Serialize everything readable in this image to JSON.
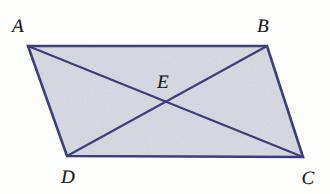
{
  "figure": {
    "kind": "geometry-diagram",
    "canvas": {
      "width": 330,
      "height": 194
    },
    "colors": {
      "background": "#fdfdfb",
      "interior_fill": "#d8dae4",
      "stroke": "#3b3f7c",
      "label_text": "#19171c"
    },
    "stroke_width": 2.4,
    "shape": {
      "name": "parallelogram",
      "vertices": [
        {
          "id": "A",
          "x": 28,
          "y": 46
        },
        {
          "id": "B",
          "x": 267,
          "y": 46
        },
        {
          "id": "C",
          "x": 303,
          "y": 157
        },
        {
          "id": "D",
          "x": 67,
          "y": 156
        }
      ],
      "polygon_points": "28,46 267,46 303,157 67,156"
    },
    "diagonals": [
      {
        "id": "AC",
        "from": "A",
        "to": "C",
        "x1": 28,
        "y1": 46,
        "x2": 303,
        "y2": 157
      },
      {
        "id": "BD",
        "from": "B",
        "to": "D",
        "x1": 267,
        "y1": 46,
        "x2": 67,
        "y2": 156
      }
    ],
    "intersection": {
      "id": "E",
      "x": 166,
      "y": 101
    },
    "labels": [
      {
        "id": "A",
        "text": "A",
        "x": 18,
        "y": 26
      },
      {
        "id": "B",
        "text": "B",
        "x": 263,
        "y": 26
      },
      {
        "id": "E",
        "text": "E",
        "x": 163,
        "y": 82
      },
      {
        "id": "D",
        "text": "D",
        "x": 68,
        "y": 177
      },
      {
        "id": "C",
        "text": "C",
        "x": 308,
        "y": 178
      }
    ]
  }
}
